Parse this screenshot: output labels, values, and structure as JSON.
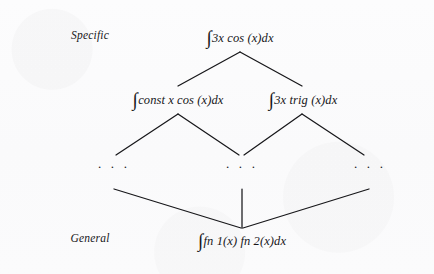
{
  "diagram": {
    "background_color": "#fbfbfc",
    "ink_color": "#17171a",
    "axis": {
      "top_label": "Specific",
      "bottom_label": "General"
    },
    "nodes": {
      "top": {
        "integral_sign": "∫",
        "expression": "3x  cos (x)dx",
        "full_text": "∫3x cos(x)dx"
      },
      "middle_left": {
        "integral_sign": "∫",
        "expression": "const  x  cos (x)dx",
        "full_text": "∫const x cos(x)dx"
      },
      "middle_right": {
        "integral_sign": "∫",
        "expression": "3x  trig (x)dx",
        "full_text": "∫3x trig(x)dx"
      },
      "bottom": {
        "integral_sign": "∫",
        "expression": "fn 1(x) fn 2(x)dx",
        "full_text": "∫fn1(x)fn2(x)dx"
      }
    },
    "ellipses": {
      "left": ". . .",
      "center": ". . .",
      "right": ". . ."
    }
  }
}
